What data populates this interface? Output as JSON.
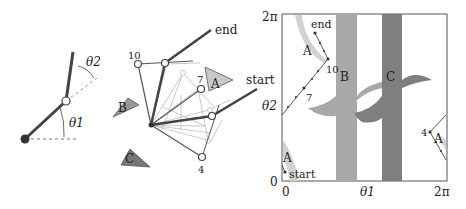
{
  "figure": {
    "panel_arm": {
      "labels": {
        "theta1": "θ1",
        "theta2": "θ2"
      }
    },
    "panel_workspace": {
      "obstacles": [
        {
          "id": "A",
          "label": "A"
        },
        {
          "id": "B",
          "label": "B"
        },
        {
          "id": "C",
          "label": "C"
        }
      ],
      "waypoint_labels": {
        "w10": "10",
        "w7": "7",
        "w4": "4"
      },
      "end_label": "end",
      "start_label": "start"
    },
    "panel_cspace": {
      "x_axis": {
        "min_label": "0",
        "max_label": "2π",
        "title": "θ1"
      },
      "y_axis": {
        "min_label": "0",
        "max_label": "2π",
        "title": "θ2"
      },
      "regions": {
        "A_top": "A",
        "A_bottom": "A",
        "A_right": "A",
        "B": "B",
        "C": "C"
      },
      "path_labels": {
        "end": "end",
        "start": "start",
        "w10": "10",
        "w7": "7",
        "w4": "4"
      },
      "colors": {
        "A": "#d2d2d2",
        "B": "#a8a8a8",
        "C": "#7f7f7f"
      }
    }
  }
}
